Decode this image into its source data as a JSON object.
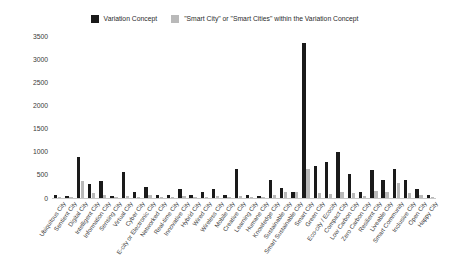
{
  "chart_data": {
    "type": "bar",
    "title": "",
    "subtitle": "",
    "xlabel": "",
    "ylabel": "",
    "ylim": [
      0,
      3500
    ],
    "yticks": [
      0,
      500,
      1000,
      1500,
      2000,
      2500,
      3000,
      3500
    ],
    "grid": false,
    "legend_position": "top-center",
    "colors": {
      "variation_concept": "#1a1a1a",
      "smart_city_within": "#b9b9b9"
    },
    "legend": [
      {
        "swatch": "#1a1a1a",
        "label": "Variation Concept"
      },
      {
        "swatch": "#b9b9b9",
        "label": "\"Smart City\" or \"Smart Cities\" within the Variation Concept"
      }
    ],
    "categories": [
      "Ubiquitous City",
      "Sentient City",
      "Digital City",
      "Intelligent City",
      "Information City",
      "Sensing City",
      "Virtual City",
      "Cyber City",
      "E-city or Electronic City",
      "Networked City",
      "Real-time City",
      "Innovative City",
      "Hybrid City",
      "Wired City",
      "Wireless City",
      "Mobile City",
      "Creative City",
      "Learning City",
      "Humane City",
      "Knowledge City",
      "Sustainable City",
      "Smart Sustainable City",
      "Smart City",
      "Green City",
      "Eco-city / Ecocity",
      "Compact City",
      "Low Carbon City",
      "Zero Carbon City",
      "Resilient City",
      "Liveable City",
      "Smart Community",
      "Inclusive City",
      "Open City",
      "Happy City"
    ],
    "series": [
      {
        "name": "Variation Concept",
        "color": "#1a1a1a",
        "values": [
          60,
          35,
          880,
          300,
          370,
          40,
          560,
          120,
          230,
          60,
          60,
          200,
          55,
          120,
          200,
          60,
          620,
          55,
          40,
          380,
          220,
          130,
          3350,
          700,
          780,
          990,
          520,
          130,
          600,
          390,
          620,
          390,
          190,
          60
        ]
      },
      {
        "name": "\"Smart City\" or \"Smart Cities\" within the Variation Concept",
        "color": "#b9b9b9",
        "values": [
          20,
          10,
          370,
          110,
          55,
          10,
          50,
          25,
          55,
          20,
          20,
          45,
          15,
          30,
          50,
          15,
          45,
          15,
          10,
          55,
          120,
          125,
          620,
          105,
          95,
          120,
          110,
          40,
          145,
          130,
          320,
          110,
          55,
          25
        ]
      }
    ]
  }
}
